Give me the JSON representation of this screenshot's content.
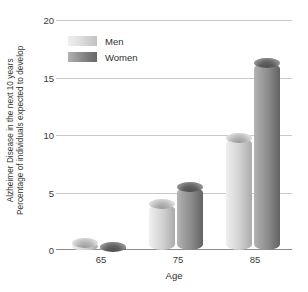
{
  "chart_data": {
    "type": "bar",
    "title": "",
    "subtitle": "",
    "categories": [
      "65",
      "75",
      "85"
    ],
    "series": [
      {
        "name": "Men",
        "values": [
          0.6,
          4.0,
          9.7
        ]
      },
      {
        "name": "Women",
        "values": [
          0.3,
          5.5,
          16.3
        ]
      }
    ],
    "xlabel": "Age",
    "ylabel": "Percentage of individuals expected to develop Alzheimer Disease in the next 10 years",
    "ylabel_lines": [
      "Percentage of individuals expected to develop",
      "Alzheimer Disease in the next 10 years"
    ],
    "ylim": [
      0,
      20
    ],
    "yticks": [
      0,
      5,
      10,
      15,
      20
    ],
    "ytick_labels": [
      "0",
      "5",
      "10",
      "15",
      "20"
    ],
    "grid": true,
    "grid_axis": "y",
    "legend": true,
    "legend_position": "upper left",
    "legend_entries": [
      "Men",
      "Women"
    ],
    "bar_style": "3d-cylinder",
    "colors": {
      "men": "#d2d2d2",
      "women": "#8f8f8f",
      "gridline": "#c9c9c9",
      "axis": "#8c8c8c",
      "text": "#3a3a3a",
      "background": "#ffffff"
    }
  }
}
